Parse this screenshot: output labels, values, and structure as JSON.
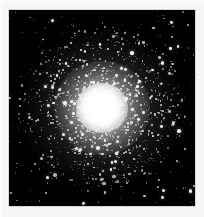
{
  "image": {
    "subject": "globular-star-cluster",
    "description": "Black-and-white astronomical photograph of a globular star cluster with a saturated bright white core, a dense resolved halo of member stars, and a sparse surrounding field of stars on a black sky.",
    "orientation": "portrait",
    "width_px": 204,
    "height_px": 217,
    "caption": "",
    "title": "",
    "alt_text": "Globular star cluster"
  },
  "colors": {
    "page_background": "#ffffff",
    "paper_margin": "#f6f6f6",
    "sky_background": "#010101",
    "photo_border": "#d8d8d8",
    "star_color": "#ffffff",
    "core_color": "#ffffff"
  },
  "photo": {
    "frame_left_px": 9,
    "frame_top_px": 10,
    "frame_width_px": 186,
    "frame_height_px": 196
  },
  "cluster": {
    "center_x_px": 103,
    "center_y_px": 108,
    "core_radius_px": 25,
    "halo_radius_px": 80,
    "core_saturated": true,
    "resolved_star_count": 0
  },
  "field_stars": {
    "count": 0,
    "note": "Sparse foreground and background stars scattered across the black sky."
  },
  "labels": {
    "none": ""
  }
}
